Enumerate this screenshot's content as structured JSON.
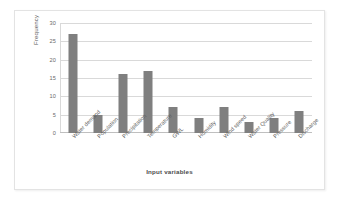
{
  "chart_data": {
    "type": "bar",
    "title": "",
    "xlabel": "Input variables",
    "ylabel": "Frequency",
    "categories": [
      "Water demand",
      "Population",
      "Precipitation",
      "Temperature",
      "GWL",
      "Humidity",
      "Wind speed",
      "Water Quality",
      "Pressure",
      "Discharge"
    ],
    "values": [
      27,
      5,
      16,
      17,
      7,
      4,
      7,
      3,
      4,
      6
    ],
    "series": [
      {
        "name": "Frequency",
        "values": [
          27,
          5,
          16,
          17,
          7,
          4,
          7,
          3,
          4,
          6
        ]
      }
    ],
    "ylim": [
      0,
      30
    ],
    "yticks": [
      0,
      5,
      10,
      15,
      20,
      25,
      30
    ],
    "ytick_labels": [
      "0",
      "5",
      "10",
      "15",
      "20",
      "25",
      "30"
    ],
    "grid": "horizontal",
    "legend": "none",
    "bar_color": "#7f7f7f",
    "gridline_color": "#d9d9d9",
    "axis_color": "#bfbfbf",
    "background_color": "#ffffff",
    "xtick_rotation_deg": -45
  }
}
